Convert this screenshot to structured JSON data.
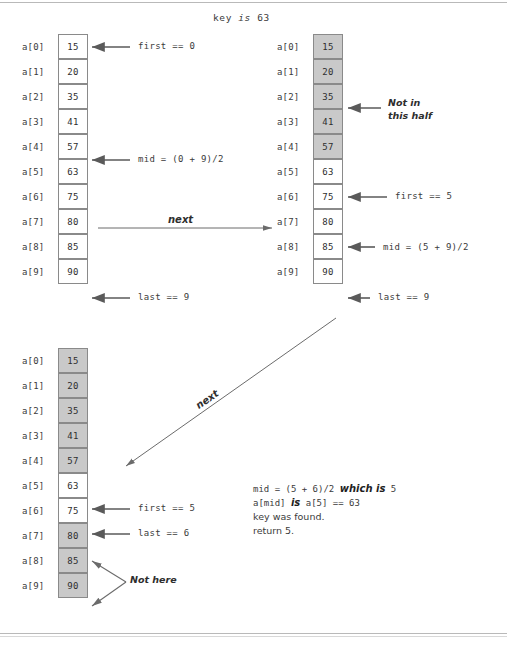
{
  "figure": {
    "title_prefix": "key",
    "title_italic": "is",
    "title_value": "63"
  },
  "arrays": [
    {
      "id": "array-step-1",
      "indices": [
        "a[0]",
        "a[1]",
        "a[2]",
        "a[3]",
        "a[4]",
        "a[5]",
        "a[6]",
        "a[7]",
        "a[8]",
        "a[9]"
      ],
      "values": [
        "15",
        "20",
        "35",
        "41",
        "57",
        "63",
        "75",
        "80",
        "85",
        "90"
      ],
      "shaded": [
        false,
        false,
        false,
        false,
        false,
        false,
        false,
        false,
        false,
        false
      ],
      "annotations": [
        {
          "name": "first-marker",
          "text": "first == 0",
          "index": 0
        },
        {
          "name": "mid-marker",
          "text": "mid = (0 + 9)/2",
          "index": 4
        },
        {
          "name": "last-marker",
          "text": "last == 9",
          "index": 9
        }
      ]
    },
    {
      "id": "array-step-2",
      "indices": [
        "a[0]",
        "a[1]",
        "a[2]",
        "a[3]",
        "a[4]",
        "a[5]",
        "a[6]",
        "a[7]",
        "a[8]",
        "a[9]"
      ],
      "values": [
        "15",
        "20",
        "35",
        "41",
        "57",
        "63",
        "75",
        "80",
        "85",
        "90"
      ],
      "shaded": [
        true,
        true,
        true,
        true,
        true,
        false,
        false,
        false,
        false,
        false
      ],
      "annotations": [
        {
          "name": "not-in-half-note-line1",
          "text": "Not in",
          "index": 2
        },
        {
          "name": "not-in-half-note-line2",
          "text": "this half",
          "index": 2
        },
        {
          "name": "first-marker",
          "text": "first == 5",
          "index": 5
        },
        {
          "name": "mid-marker",
          "text": "mid = (5 + 9)/2",
          "index": 7
        },
        {
          "name": "last-marker",
          "text": "last == 9",
          "index": 9
        }
      ]
    },
    {
      "id": "array-step-3",
      "indices": [
        "a[0]",
        "a[1]",
        "a[2]",
        "a[3]",
        "a[4]",
        "a[5]",
        "a[6]",
        "a[7]",
        "a[8]",
        "a[9]"
      ],
      "values": [
        "15",
        "20",
        "35",
        "41",
        "57",
        "63",
        "75",
        "80",
        "85",
        "90"
      ],
      "shaded": [
        true,
        true,
        true,
        true,
        true,
        false,
        false,
        true,
        true,
        true
      ],
      "annotations": [
        {
          "name": "first-marker",
          "text": "first == 5",
          "index": 5
        },
        {
          "name": "last-marker",
          "text": "last == 6",
          "index": 6
        },
        {
          "name": "not-here-note",
          "text": "Not here",
          "index": 8
        }
      ]
    }
  ],
  "transitions": [
    {
      "name": "next-horizontal",
      "label": "next"
    },
    {
      "name": "next-diagonal",
      "label": "next"
    }
  ],
  "result": {
    "line1_code": "mid = (5 + 6)/2",
    "line1_emph": "which is",
    "line1_value": "5",
    "line2_a": "a[mid]",
    "line2_emph": "is",
    "line2_b": "a[5] == 63",
    "line3": "key was found.",
    "line4": "return 5."
  },
  "colors": {
    "cell_border": "#8a8a8a",
    "cell_shaded": "#c9c9c9",
    "cell_plain": "#ffffff",
    "text": "#3b3b3b",
    "arrow": "#5a5a5a"
  }
}
